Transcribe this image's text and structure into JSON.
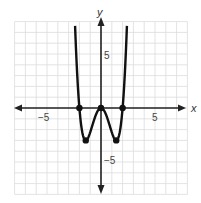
{
  "chart_data": {
    "type": "line",
    "title": "",
    "xlabel": "x",
    "ylabel": "y",
    "xlim": [
      -8,
      8
    ],
    "ylim": [
      -8,
      8
    ],
    "grid": true,
    "tick_labels": {
      "x": [
        "-5",
        "5"
      ],
      "y": [
        "5",
        "-5"
      ]
    },
    "function": "y = 0.75x^4 - 3x^2",
    "marked_points": [
      [
        -2,
        0
      ],
      [
        0,
        0
      ],
      [
        2,
        0
      ],
      [
        -1.41,
        -3
      ],
      [
        1.41,
        -3
      ]
    ],
    "series": [
      {
        "name": "curve",
        "x": [
          -2.45,
          -2,
          -1.41,
          -0.7,
          0,
          0.7,
          1.41,
          2,
          2.45
        ],
        "y": [
          9,
          0,
          -3,
          -1.3,
          0,
          -1.3,
          -3,
          0,
          9
        ]
      }
    ]
  },
  "labels": {
    "x_axis": "x",
    "y_axis": "y",
    "x_neg": "−5",
    "x_pos": "5",
    "y_pos": "5",
    "y_neg": "−5"
  }
}
